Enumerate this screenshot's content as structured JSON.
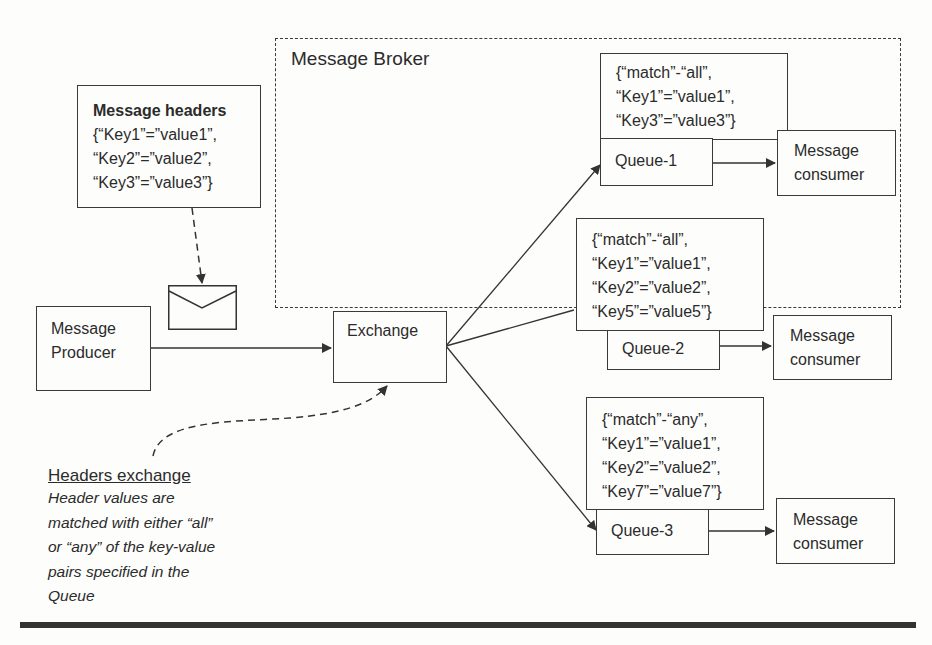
{
  "diagram": {
    "broker": {
      "label": "Message Broker"
    },
    "message_headers": {
      "title": "Message headers",
      "lines": [
        "{“Key1”=”value1”,",
        "“Key2”=”value2”,",
        "“Key3”=”value3”}"
      ]
    },
    "producer": {
      "lines": [
        "Message",
        "Producer"
      ]
    },
    "exchange": {
      "label": "Exchange"
    },
    "queues": [
      {
        "name": "Queue-1",
        "rules": [
          "{“match”-“all”,",
          "“Key1”=”value1”,",
          "“Key3”=”value3”}"
        ],
        "consumer": [
          "Message",
          "consumer"
        ]
      },
      {
        "name": "Queue-2",
        "rules": [
          "{“match”-“all”,",
          "“Key1”=”value1”,",
          "“Key2”=”value2”,",
          "“Key5”=”value5”}"
        ],
        "consumer": [
          "Message",
          "consumer"
        ]
      },
      {
        "name": "Queue-3",
        "rules": [
          "{“match”-“any”,",
          "“Key1”=”value1”,",
          "“Key2”=”value2”,",
          "“Key7”=”value7”}"
        ],
        "consumer": [
          "Message",
          "consumer"
        ]
      }
    ],
    "caption": {
      "title": "Headers exchange",
      "lines": [
        "Header values are",
        "matched with either “all”",
        "or “any” of the key-value",
        "pairs specified in the",
        "Queue"
      ]
    },
    "colors": {
      "line": "#3a3a3a",
      "background": "#fdfdfb",
      "text": "#2b2b2b"
    }
  }
}
